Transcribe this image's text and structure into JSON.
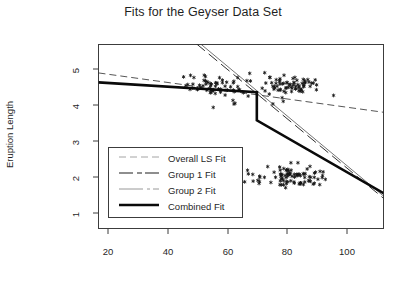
{
  "chart_data": {
    "type": "scatter",
    "title": "Fits for the Geyser Data Set",
    "xlabel": "",
    "ylabel": "Eruption Length",
    "xlim": [
      14,
      113
    ],
    "ylim": [
      0.55,
      5.6
    ],
    "xticks": [
      20,
      40,
      60,
      80,
      100
    ],
    "yticks": [
      1,
      2,
      3,
      4,
      5
    ],
    "grid": false,
    "legend_position": "lower-left",
    "marker": "asterisk",
    "series": [
      {
        "name": "Overall LS Fit",
        "type": "line",
        "style": "dashed",
        "width": 0.8,
        "color": "#2b2b2b",
        "points": [
          [
            14,
            4.82
          ],
          [
            113,
            3.74
          ]
        ]
      },
      {
        "name": "Group 1 Fit",
        "type": "line",
        "style": "dashed",
        "width": 0.9,
        "color": "#1a1a1a",
        "points": [
          [
            48.0,
            5.62
          ],
          [
            113,
            1.38
          ]
        ]
      },
      {
        "name": "Group 2 Fit",
        "type": "line",
        "style": "solid-thin",
        "width": 0.7,
        "color": "#3a3a3a",
        "points": [
          [
            49.4,
            5.62
          ],
          [
            113,
            1.44
          ]
        ]
      },
      {
        "name": "Combined Fit",
        "type": "line",
        "style": "solid-thick",
        "width": 2.6,
        "color": "#0a0a0a",
        "points": [
          [
            14,
            4.56
          ],
          [
            69.0,
            4.29
          ],
          [
            69.0,
            3.52
          ],
          [
            113,
            1.52
          ]
        ]
      }
    ],
    "scatter": {
      "name": "Geyser observations",
      "n": 272,
      "x": [
        79,
        54,
        74,
        62,
        85,
        55,
        88,
        85,
        51,
        85,
        54,
        84,
        78,
        47,
        83,
        52,
        62,
        84,
        52,
        79,
        51,
        47,
        78,
        69,
        74,
        83,
        55,
        76,
        78,
        79,
        73,
        77,
        66,
        80,
        74,
        52,
        48,
        80,
        59,
        90,
        80,
        58,
        84,
        58,
        73,
        83,
        64,
        53,
        82,
        59,
        75,
        90,
        54,
        80,
        54,
        83,
        71,
        64,
        77,
        81,
        59,
        84,
        48,
        82,
        60,
        92,
        78,
        78,
        65,
        73,
        82,
        56,
        79,
        71,
        62,
        76,
        60,
        78,
        76,
        83,
        75,
        82,
        70,
        65,
        73,
        88,
        76,
        80,
        48,
        86,
        60,
        90,
        50,
        78,
        63,
        72,
        84,
        75,
        51,
        82,
        62,
        88,
        49,
        83,
        81,
        47,
        84,
        52,
        86,
        81,
        75,
        59,
        89,
        79,
        59,
        81,
        50,
        85,
        59,
        87,
        53,
        69,
        77,
        56,
        88,
        81,
        45,
        82,
        55,
        90,
        45,
        83,
        56,
        89,
        46,
        82,
        51,
        86,
        53,
        79,
        81,
        60,
        82,
        77,
        76,
        59,
        80,
        49,
        96,
        53,
        77,
        77,
        65,
        81,
        71,
        70,
        81,
        93,
        53,
        89,
        45,
        86,
        58,
        78,
        66,
        76,
        63,
        88,
        52,
        93,
        49,
        57,
        77,
        68,
        81,
        81,
        84,
        80,
        74,
        62,
        84,
        52,
        81,
        61,
        87,
        49,
        87,
        78,
        83,
        71,
        80,
        67,
        76,
        59,
        79,
        53,
        84,
        79,
        54,
        76,
        78,
        78,
        85,
        54,
        79,
        59,
        81,
        80,
        56,
        69,
        83,
        79,
        47,
        78,
        62,
        92,
        53,
        78,
        78,
        78,
        82,
        84,
        77,
        50,
        56,
        86,
        85,
        47,
        62,
        78,
        83,
        54,
        87,
        48,
        89,
        56,
        87,
        51,
        78,
        58,
        84,
        57,
        79,
        57,
        82,
        84,
        44,
        88,
        54,
        86,
        44,
        79,
        58,
        86,
        57,
        82,
        56,
        81,
        54,
        80,
        51,
        89,
        52,
        89,
        56,
        84,
        52,
        78,
        76,
        58,
        83,
        50,
        84,
        54
      ],
      "y": [
        4.4,
        3.9,
        4.0,
        4.0,
        4.6,
        2.0,
        4.6,
        1.8,
        4.6,
        4.6,
        1.9,
        4.5,
        4.3,
        2.2,
        4.4,
        2.0,
        4.1,
        1.8,
        4.5,
        2.2,
        4.5,
        1.8,
        4.4,
        1.9,
        4.7,
        1.8,
        4.6,
        2.0,
        4.1,
        4.1,
        4.3,
        1.8,
        4.8,
        1.8,
        4.2,
        2.0,
        4.5,
        1.7,
        4.2,
        1.8,
        4.4,
        2.0,
        4.5,
        1.8,
        4.5,
        2.0,
        4.3,
        1.8,
        4.4,
        1.9,
        4.5,
        2.1,
        4.5,
        2.0,
        4.4,
        2.0,
        4.6,
        1.8,
        4.3,
        2.3,
        4.6,
        1.8,
        4.4,
        2.0,
        4.3,
        2.0,
        4.5,
        1.9,
        4.2,
        2.2,
        4.7,
        2.0,
        4.3,
        1.8,
        4.5,
        2.1,
        4.4,
        1.9,
        4.6,
        2.0,
        4.5,
        1.8,
        4.3,
        2.2,
        4.8,
        1.9,
        4.4,
        2.0,
        4.5,
        2.0,
        4.4,
        1.9,
        4.7,
        2.2,
        4.4,
        2.0,
        4.5,
        1.8,
        4.3,
        2.0,
        4.6,
        1.8,
        4.4,
        2.3,
        4.5,
        2.0,
        4.3,
        1.9,
        4.6,
        2.0,
        4.4,
        1.8,
        4.5,
        2.2,
        4.4,
        2.0,
        4.7,
        1.8,
        4.3,
        2.0,
        4.6,
        2.0,
        4.4,
        1.9,
        4.5,
        2.1,
        4.4,
        2.0,
        4.3,
        1.8,
        4.7,
        2.0,
        4.5,
        1.9,
        4.4,
        2.2,
        4.6,
        2.0,
        4.3,
        1.8,
        4.5,
        4.0,
        4.4,
        1.9,
        4.6,
        2.0,
        4.4,
        2.2,
        4.2,
        2.0,
        4.5,
        1.8,
        4.6,
        2.0,
        4.4,
        1.9,
        4.7,
        2.1,
        4.3,
        1.8,
        4.5,
        2.0,
        4.4,
        2.0,
        4.6,
        1.8,
        4.3,
        2.2,
        4.5,
        1.9,
        4.4,
        2.0,
        4.6,
        2.0,
        4.5,
        1.8,
        4.3,
        2.1,
        4.7,
        2.0,
        4.4,
        1.9,
        4.5,
        2.0,
        4.4,
        2.2,
        4.6,
        1.8,
        4.3,
        2.0,
        4.5,
        2.0,
        4.4,
        1.9,
        4.7,
        2.1,
        4.5,
        1.8,
        4.3,
        2.0,
        4.6,
        2.0,
        4.4,
        2.2,
        4.5,
        1.9,
        4.4,
        2.0,
        4.6,
        1.8,
        4.3,
        2.0,
        4.7,
        2.1,
        4.5,
        1.9,
        4.4,
        2.0,
        4.5,
        2.2,
        4.6,
        1.8,
        4.3,
        2.0,
        4.4,
        2.0,
        4.5,
        1.9,
        4.7,
        2.1,
        4.4,
        1.8,
        4.6,
        2.0,
        4.3,
        2.0,
        4.5,
        2.2,
        4.4,
        1.9,
        4.6,
        2.0,
        4.5,
        1.8,
        4.3,
        2.0,
        4.7,
        2.1,
        4.4,
        1.9,
        4.5,
        2.0,
        4.6,
        2.2,
        4.3,
        1.8,
        4.4,
        2.0,
        4.5,
        2.0,
        4.6,
        1.9,
        4.3,
        2.1,
        4.7,
        1.8,
        4.5
      ]
    },
    "annotations": [
      {
        "text": "combined fit step discontinuity at x = 69"
      }
    ]
  },
  "legend": {
    "items": [
      {
        "label": "Overall LS Fit"
      },
      {
        "label": "Group 1 Fit"
      },
      {
        "label": "Group 2 Fit"
      },
      {
        "label": "Combined Fit"
      }
    ]
  },
  "axes": {
    "xtick_labels": [
      "20",
      "40",
      "60",
      "80",
      "100"
    ],
    "ytick_labels": [
      "1",
      "2",
      "3",
      "4",
      "5"
    ]
  }
}
